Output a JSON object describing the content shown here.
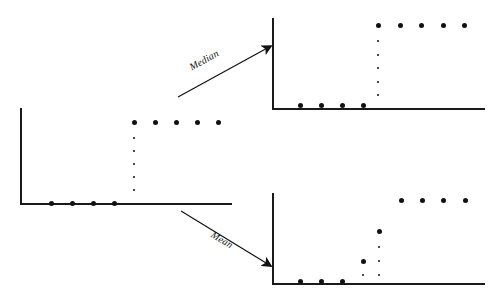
{
  "figure": {
    "width": 498,
    "height": 301,
    "background": "#ffffff",
    "ink_color": "#111111",
    "axis_color": "#1a1a1a"
  },
  "annotations": [
    {
      "name": "median-arrow",
      "label": "Median",
      "direction": "up-right",
      "from": [
        178,
        97
      ],
      "to": [
        271,
        46
      ],
      "label_pos": [
        190,
        62
      ],
      "label_rotation": -29
    },
    {
      "name": "mean-arrow",
      "label": "Mean",
      "direction": "down-right",
      "from": [
        181,
        211
      ],
      "to": [
        271,
        266
      ],
      "label_pos": [
        212,
        228
      ],
      "label_rotation": 31
    }
  ],
  "chart_data": [
    {
      "id": "original-step",
      "type": "scatter",
      "title": "",
      "xlabel": "",
      "ylabel": "",
      "grid": false,
      "legend": "none",
      "axes": {
        "origin": [
          20,
          203
        ],
        "x_end": 232,
        "y_top": 108
      },
      "points_low": [
        {
          "x": 51,
          "y": 203,
          "size": "big"
        },
        {
          "x": 72,
          "y": 203,
          "size": "big"
        },
        {
          "x": 93,
          "y": 203,
          "size": "big"
        },
        {
          "x": 114,
          "y": 203,
          "size": "big"
        }
      ],
      "points_high": [
        {
          "x": 134,
          "y": 122,
          "size": "big"
        },
        {
          "x": 155,
          "y": 122,
          "size": "big"
        },
        {
          "x": 176,
          "y": 122,
          "size": "big"
        },
        {
          "x": 197,
          "y": 122,
          "size": "big"
        },
        {
          "x": 218,
          "y": 122,
          "size": "big"
        }
      ],
      "dotted_risers": [
        {
          "x": 134,
          "y_from": 138,
          "y_to": 190,
          "step": 13,
          "size": "small"
        }
      ],
      "values": [
        0,
        0,
        0,
        0,
        1,
        1,
        1,
        1,
        1
      ],
      "categories": [
        "1",
        "2",
        "3",
        "4",
        "5",
        "6",
        "7",
        "8",
        "9"
      ],
      "ylim": [
        0,
        1
      ]
    },
    {
      "id": "median-robust-step",
      "type": "scatter",
      "title": "",
      "xlabel": "",
      "ylabel": "",
      "grid": false,
      "legend": "none",
      "axes": {
        "origin": [
          272,
          108
        ],
        "x_end": 485,
        "y_top": 18
      },
      "points_low": [
        {
          "x": 300,
          "y": 105,
          "size": "big"
        },
        {
          "x": 321,
          "y": 105,
          "size": "big"
        },
        {
          "x": 342,
          "y": 105,
          "size": "big"
        },
        {
          "x": 363,
          "y": 105,
          "size": "big"
        }
      ],
      "points_high": [
        {
          "x": 378,
          "y": 25,
          "size": "big"
        },
        {
          "x": 400,
          "y": 25,
          "size": "big"
        },
        {
          "x": 421,
          "y": 25,
          "size": "big"
        },
        {
          "x": 443,
          "y": 25,
          "size": "big"
        },
        {
          "x": 464,
          "y": 25,
          "size": "big"
        }
      ],
      "dotted_risers": [
        {
          "x": 378,
          "y_from": 41,
          "y_to": 95,
          "step": 13.5,
          "size": "small"
        }
      ],
      "values": [
        0,
        0,
        0,
        0,
        1,
        1,
        1,
        1,
        1
      ],
      "categories": [
        "1",
        "2",
        "3",
        "4",
        "5",
        "6",
        "7",
        "8",
        "9"
      ],
      "ylim": [
        0,
        1
      ]
    },
    {
      "id": "mean-smoothed-step",
      "type": "scatter",
      "title": "",
      "xlabel": "",
      "ylabel": "",
      "grid": false,
      "legend": "none",
      "axes": {
        "origin": [
          272,
          283
        ],
        "x_end": 485,
        "y_top": 193
      },
      "points_low": [
        {
          "x": 300,
          "y": 281,
          "size": "big"
        },
        {
          "x": 321,
          "y": 281,
          "size": "big"
        },
        {
          "x": 342,
          "y": 281,
          "size": "big"
        }
      ],
      "points_mid": [
        {
          "x": 363,
          "y": 261,
          "size": "big"
        },
        {
          "x": 379,
          "y": 231,
          "size": "big"
        }
      ],
      "points_high": [
        {
          "x": 401,
          "y": 200,
          "size": "big"
        },
        {
          "x": 422,
          "y": 200,
          "size": "big"
        },
        {
          "x": 443,
          "y": 200,
          "size": "big"
        },
        {
          "x": 465,
          "y": 200,
          "size": "big"
        }
      ],
      "dotted_risers": [
        {
          "x": 363,
          "y_from": 275,
          "y_to": 275,
          "step": 14,
          "size": "small"
        },
        {
          "x": 379,
          "y_from": 247,
          "y_to": 275,
          "step": 14,
          "size": "small"
        }
      ],
      "values": [
        0,
        0,
        0,
        0.25,
        0.62,
        1,
        1,
        1,
        1
      ],
      "categories": [
        "1",
        "2",
        "3",
        "4",
        "5",
        "6",
        "7",
        "8",
        "9"
      ],
      "ylim": [
        0,
        1
      ]
    }
  ]
}
